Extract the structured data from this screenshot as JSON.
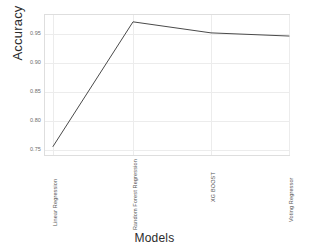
{
  "chart_data": {
    "type": "line",
    "title": "",
    "xlabel": "Models",
    "ylabel": "Accuracy",
    "categories": [
      "Linear Regression",
      "Random Forest Regression",
      "XG BOOST",
      "Voting Regressor"
    ],
    "values": [
      0.735,
      0.972,
      0.951,
      0.945
    ],
    "series": [
      {
        "name": "Accuracy",
        "values": [
          0.735,
          0.972,
          0.951,
          0.945
        ]
      }
    ],
    "ylim": [
      0.715,
      0.985
    ],
    "yticks": [
      0.95,
      0.9,
      0.85,
      0.8,
      0.75
    ],
    "ytick_labels": [
      "0.95",
      "0.90",
      "0.85",
      "0.80",
      "0.75"
    ],
    "grid": true,
    "legend": false,
    "legend_position": "none",
    "line_color": "#4a4a4a"
  },
  "axis": {
    "y_title": "Accuracy",
    "x_title": "Models",
    "y_tick_0": "0.95",
    "y_tick_1": "0.90",
    "y_tick_2": "0.85",
    "y_tick_3": "0.80",
    "y_tick_4": "0.75",
    "x_tick_0": "Linear Regression",
    "x_tick_1": "Random Forest Regression",
    "x_tick_2": "XG BOOST",
    "x_tick_3": "Voting Regressor"
  }
}
